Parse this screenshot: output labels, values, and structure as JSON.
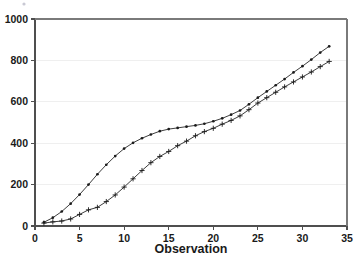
{
  "chart_data": {
    "type": "line",
    "title": "",
    "subtitle": "",
    "xlabel": "Observation",
    "ylabel": "",
    "xlim": [
      0,
      35
    ],
    "ylim": [
      0,
      1000
    ],
    "xticks": [
      0,
      5,
      10,
      15,
      20,
      25,
      30,
      35
    ],
    "yticks": [
      0,
      200,
      400,
      600,
      800,
      1000
    ],
    "xtick_labels": [
      "0",
      "5",
      "10",
      "15",
      "20",
      "25",
      "30",
      "35"
    ],
    "ytick_labels": [
      "0",
      "200",
      "400",
      "600",
      "800",
      "1000"
    ],
    "grid": true,
    "grid_axis": "y",
    "legend": false,
    "legend_position": "none",
    "x": [
      1,
      2,
      3,
      4,
      5,
      6,
      7,
      8,
      9,
      10,
      11,
      12,
      13,
      14,
      15,
      16,
      17,
      18,
      19,
      20,
      21,
      22,
      23,
      24,
      25,
      26,
      27,
      28,
      29,
      30,
      31,
      32,
      33
    ],
    "series": [
      {
        "name": "series-dots",
        "marker": "dot",
        "line_color": "#1a1a1a",
        "values": [
          18,
          40,
          70,
          108,
          152,
          200,
          250,
          296,
          338,
          374,
          402,
          424,
          442,
          458,
          468,
          474,
          480,
          486,
          494,
          506,
          520,
          538,
          558,
          588,
          620,
          650,
          680,
          710,
          742,
          772,
          804,
          838,
          868
        ]
      },
      {
        "name": "series-plus",
        "marker": "plus",
        "line_color": "#1a1a1a",
        "values": [
          14,
          20,
          24,
          34,
          56,
          78,
          90,
          118,
          150,
          188,
          228,
          268,
          306,
          336,
          360,
          388,
          410,
          436,
          456,
          472,
          492,
          510,
          532,
          562,
          594,
          620,
          646,
          672,
          696,
          720,
          744,
          770,
          795
        ]
      }
    ]
  },
  "plot": {
    "frame_left": 35,
    "frame_right": 347,
    "frame_top": 19,
    "frame_bottom": 226
  }
}
